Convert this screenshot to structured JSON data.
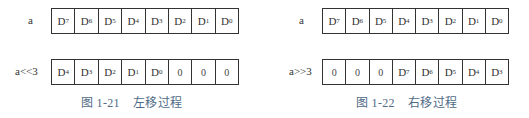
{
  "left_figure": {
    "top_row": {
      "label": "a",
      "cells": [
        {
          "base": "D",
          "sub": "7"
        },
        {
          "base": "D",
          "sub": "6"
        },
        {
          "base": "D",
          "sub": "5"
        },
        {
          "base": "D",
          "sub": "4"
        },
        {
          "base": "D",
          "sub": "3"
        },
        {
          "base": "D",
          "sub": "2"
        },
        {
          "base": "D",
          "sub": "1"
        },
        {
          "base": "D",
          "sub": "0"
        }
      ]
    },
    "bottom_row": {
      "label": "a<<3",
      "cells": [
        {
          "base": "D",
          "sub": "4"
        },
        {
          "base": "D",
          "sub": "3"
        },
        {
          "base": "D",
          "sub": "2"
        },
        {
          "base": "D",
          "sub": "1"
        },
        {
          "base": "D",
          "sub": "0"
        },
        {
          "base": "0",
          "sub": ""
        },
        {
          "base": "0",
          "sub": ""
        },
        {
          "base": "0",
          "sub": ""
        }
      ]
    },
    "caption": "图 1-21    左移过程"
  },
  "right_figure": {
    "top_row": {
      "label": "a",
      "cells": [
        {
          "base": "D",
          "sub": "7"
        },
        {
          "base": "D",
          "sub": "6"
        },
        {
          "base": "D",
          "sub": "5"
        },
        {
          "base": "D",
          "sub": "4"
        },
        {
          "base": "D",
          "sub": "3"
        },
        {
          "base": "D",
          "sub": "2"
        },
        {
          "base": "D",
          "sub": "1"
        },
        {
          "base": "D",
          "sub": "0"
        }
      ]
    },
    "bottom_row": {
      "label": "a>>3",
      "cells": [
        {
          "base": "0",
          "sub": ""
        },
        {
          "base": "0",
          "sub": ""
        },
        {
          "base": "0",
          "sub": ""
        },
        {
          "base": "D",
          "sub": "7"
        },
        {
          "base": "D",
          "sub": "6"
        },
        {
          "base": "D",
          "sub": "5"
        },
        {
          "base": "D",
          "sub": "4"
        },
        {
          "base": "D",
          "sub": "3"
        }
      ]
    },
    "caption": "图 1-22    右移过程"
  },
  "colors": {
    "border": "#333333",
    "caption": "#4f6a86"
  }
}
